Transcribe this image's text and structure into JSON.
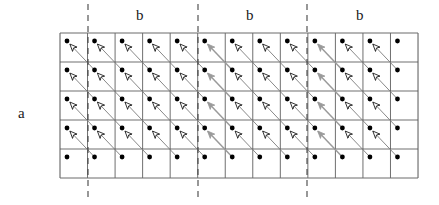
{
  "figure": {
    "title": "",
    "labels": {
      "a_label": "a",
      "b_label_1": "b",
      "b_label_2": "b",
      "b_label_3": "b"
    },
    "colors": {
      "grid_line": "#555555",
      "grid_border": "#6b6b6b",
      "dot": "#000000",
      "arrow_line": "#7a7a7a",
      "arrow_head_open_fill": "#ffffff",
      "arrow_head_open_stroke": "#000000",
      "arrow_head_filled": "#9a9a9a",
      "dashed_line": "#444444",
      "background": "#ffffff"
    }
  },
  "chart_data": {
    "type": "diagram",
    "title": "",
    "xlabel": "b",
    "ylabel": "a",
    "grid": {
      "columns": 13,
      "rows": 5,
      "x0": 60,
      "y0": 33,
      "cell_width": 27.54,
      "cell_height": 29.0,
      "width": 358,
      "height": 145,
      "grid_on": true
    },
    "dot": {
      "radius": 2.4,
      "offset_x": 7,
      "offset_y": 8
    },
    "vector": {
      "dx": 27.54,
      "dy": 29.0,
      "direction": "up-left",
      "comment": "each arrow starts one cell down-right of its target dot and points up-left at the dot"
    },
    "dashed_lines_x": [
      88,
      198,
      307
    ],
    "dashed_line_y_range": [
      4,
      198
    ],
    "filled_arrow_columns": [
      5,
      9
    ],
    "legend": {
      "show": false
    },
    "annotations": [
      {
        "text": "a",
        "x": 22,
        "y": 113,
        "role": "row-period-label"
      },
      {
        "text": "b",
        "x": 140,
        "y": 16,
        "role": "column-period-label"
      },
      {
        "text": "b",
        "x": 250,
        "y": 16,
        "role": "column-period-label"
      },
      {
        "text": "b",
        "x": 360,
        "y": 16,
        "role": "column-period-label"
      }
    ]
  }
}
